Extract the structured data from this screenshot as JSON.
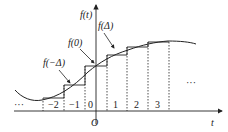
{
  "diagram": {
    "axes": {
      "x_label": "t",
      "y_label": "f(t)",
      "origin_label": "O"
    },
    "interval_labels": [
      "−2",
      "−1",
      "0",
      "1",
      "2",
      "3"
    ],
    "ellipsis_left": "···",
    "ellipsis_right": "···",
    "annotations": [
      {
        "label": "f(−Δ)"
      },
      {
        "label": "f(0)"
      },
      {
        "label": "f(Δ)"
      }
    ],
    "colors": {
      "stroke": "#222222",
      "background": "#ffffff"
    }
  }
}
